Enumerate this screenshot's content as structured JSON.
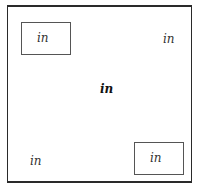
{
  "diagram": {
    "labels": {
      "top_left": "in",
      "top_right": "in",
      "center": "in",
      "bottom_left": "in",
      "bottom_right": "in"
    },
    "boxed": [
      "top_left",
      "bottom_right"
    ],
    "emphasized": [
      "center"
    ]
  }
}
